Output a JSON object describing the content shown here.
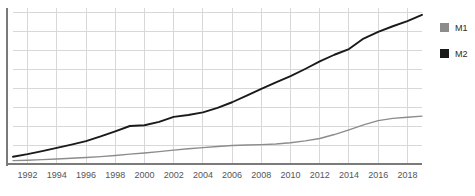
{
  "chart_data": {
    "type": "line",
    "title": "",
    "subtitle": "",
    "xlabel": "",
    "ylabel": "",
    "grid": true,
    "legend_position": "right",
    "xlim": [
      1991,
      2019
    ],
    "ylim": [
      0,
      8
    ],
    "x": [
      1991,
      1992,
      1993,
      1994,
      1995,
      1996,
      1997,
      1998,
      1999,
      2000,
      2001,
      2002,
      2003,
      2004,
      2005,
      2006,
      2007,
      2008,
      2009,
      2010,
      2011,
      2012,
      2013,
      2014,
      2015,
      2016,
      2017,
      2018,
      2019
    ],
    "x_tick_labels": [
      "1992",
      "1994",
      "1996",
      "1998",
      "2000",
      "2002",
      "2004",
      "2006",
      "2008",
      "2010",
      "2012",
      "2014",
      "2016",
      "2018"
    ],
    "x_ticks": [
      1992,
      1994,
      1996,
      1998,
      2000,
      2002,
      2004,
      2006,
      2008,
      2010,
      2012,
      2014,
      2016,
      2018
    ],
    "y_tick_labels": [],
    "y_gridline_count": 8,
    "series": [
      {
        "name": "M1",
        "color": "#8c8c8c",
        "values": [
          0.18,
          0.2,
          0.23,
          0.26,
          0.3,
          0.34,
          0.39,
          0.45,
          0.52,
          0.58,
          0.65,
          0.73,
          0.8,
          0.86,
          0.92,
          0.97,
          1.0,
          1.02,
          1.05,
          1.12,
          1.22,
          1.34,
          1.55,
          1.8,
          2.06,
          2.28,
          2.4,
          2.46,
          2.52
        ]
      },
      {
        "name": "M2",
        "color": "#1a1a1a",
        "values": [
          0.38,
          0.52,
          0.68,
          0.85,
          1.02,
          1.2,
          1.45,
          1.72,
          2.0,
          2.04,
          2.22,
          2.48,
          2.58,
          2.72,
          2.95,
          3.25,
          3.6,
          3.95,
          4.3,
          4.62,
          5.0,
          5.4,
          5.75,
          6.05,
          6.6,
          6.95,
          7.25,
          7.52,
          7.85
        ]
      }
    ]
  },
  "legend": {
    "items": [
      {
        "label": "M1",
        "color": "#8c8c8c"
      },
      {
        "label": "M2",
        "color": "#1a1a1a"
      }
    ]
  },
  "footer": {
    "text": ""
  },
  "colors": {
    "axis": "#7a7a7a",
    "grid": "#d8d8d8",
    "tick_text": "#555555",
    "background": "#ffffff"
  }
}
